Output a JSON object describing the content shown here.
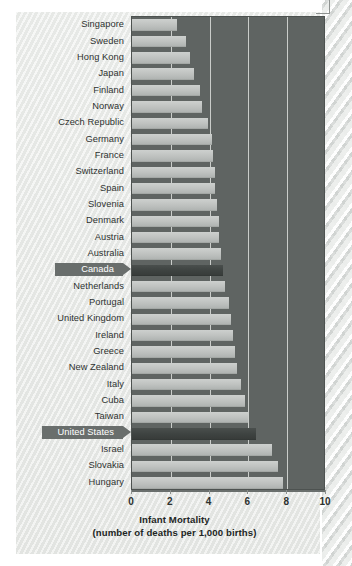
{
  "figure": {
    "title_line1": "Infant Mortality",
    "title_line2": "(number of deaths per 1,000 births)"
  },
  "colors": {
    "plot_background": "#5f6462",
    "bar": "#bfc2c0",
    "bar_highlight": "#3e4341",
    "page_background": "#e9ebe9",
    "gridline": "#e8eae8",
    "text": "#2e3230",
    "tag_background": "#696e6c",
    "tag_text": "#ffffff"
  },
  "chart_data": {
    "type": "bar",
    "orientation": "horizontal",
    "title": "Infant Mortality",
    "subtitle": "(number of deaths per 1,000 births)",
    "xlabel": "Infant Mortality (number of deaths per 1,000 births)",
    "ylabel": "",
    "xlim": [
      0,
      10
    ],
    "xticks": [
      0,
      2,
      4,
      6,
      8,
      10
    ],
    "xticklabels": [
      "0",
      "2",
      "4",
      "6",
      "8",
      "10"
    ],
    "grid": "vertical",
    "legend": "none",
    "highlight_countries": [
      "Canada",
      "United States"
    ],
    "categories": [
      "Singapore",
      "Sweden",
      "Hong Kong",
      "Japan",
      "Finland",
      "Norway",
      "Czech Republic",
      "Germany",
      "France",
      "Switzerland",
      "Spain",
      "Slovenia",
      "Denmark",
      "Austria",
      "Australia",
      "Canada",
      "Netherlands",
      "Portugal",
      "United Kingdom",
      "Ireland",
      "Greece",
      "New Zealand",
      "Italy",
      "Cuba",
      "Taiwan",
      "United States",
      "Israel",
      "Slovakia",
      "Hungary"
    ],
    "values": [
      2.3,
      2.8,
      3.0,
      3.2,
      3.5,
      3.6,
      3.9,
      4.1,
      4.2,
      4.3,
      4.3,
      4.4,
      4.5,
      4.5,
      4.6,
      4.7,
      4.8,
      5.0,
      5.1,
      5.2,
      5.3,
      5.4,
      5.6,
      5.8,
      6.0,
      6.4,
      7.2,
      7.5,
      7.8
    ]
  }
}
